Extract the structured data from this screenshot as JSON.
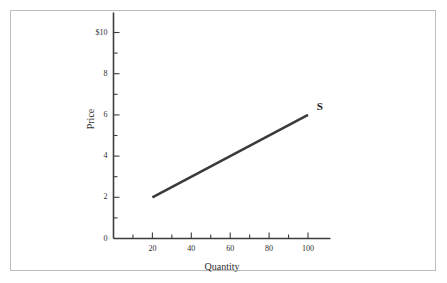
{
  "chart_data": {
    "type": "line",
    "title": "",
    "subtitle": "",
    "xlabel": "Quantity",
    "ylabel": "Price",
    "xlim": [
      0,
      110
    ],
    "ylim": [
      0,
      11
    ],
    "grid": false,
    "legend_position": "inline-right-end",
    "x_major_ticks": [
      20,
      40,
      60,
      80,
      100
    ],
    "x_major_tick_labels": [
      "20",
      "40",
      "60",
      "80",
      "100"
    ],
    "x_minor_ticks": [
      10,
      30,
      50,
      70,
      90
    ],
    "y_major_ticks": [
      0,
      2,
      4,
      6,
      8,
      10
    ],
    "y_major_tick_labels": [
      "0",
      "2",
      "4",
      "6",
      "8",
      "$10"
    ],
    "y_minor_ticks": [
      1,
      3,
      5,
      7,
      9
    ],
    "series": [
      {
        "name": "S",
        "label": "S",
        "kind": "supply-curve",
        "color": "#3a3a3a",
        "line_width": 2.5,
        "points": [
          {
            "x": 20,
            "y": 2
          },
          {
            "x": 100,
            "y": 6
          }
        ]
      }
    ],
    "annotations": [
      {
        "name": "supply-curve-label",
        "text": "S",
        "x": 103,
        "y": 6.4
      }
    ]
  },
  "axis": {
    "x_title": "Quantity",
    "y_title": "Price"
  },
  "colors": {
    "curve": "#3a3a3a",
    "axis": "#3d3d3d",
    "frame": "#bdbdbd",
    "text": "#2e2e2e",
    "background": "#ffffff"
  }
}
